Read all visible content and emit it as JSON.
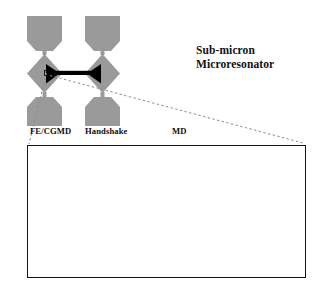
{
  "figure": {
    "title_line1": "Sub-micron",
    "title_line2": "Microresonator",
    "region_labels": [
      {
        "id": "fe-cgmd",
        "label": "FE/CGMD"
      },
      {
        "id": "handshake",
        "label": "Handshake"
      },
      {
        "id": "md",
        "label": "MD"
      }
    ],
    "colors": {
      "pad_gray": "#9a9a9a",
      "beam_black": "#000000",
      "panel_border": "#141414",
      "mesh_line": "#7d7d7d",
      "lattice_black": "#000000",
      "background": "#ffffff",
      "leader_dash": "#8c8c8c"
    },
    "schematic": {
      "description": "Two mirrored anchor pads with diamond-shaped flexures joined by a horizontal bowtie beam",
      "anchor_count": 4,
      "diamond_count": 2,
      "beam_count": 1
    },
    "panel": {
      "description": "Multiscale simulation domain: coarse finite-element / coarse-grained molecular dynamics mesh at left, graded handshake transition, full atomistic molecular dynamics lattice at right with a notched neck",
      "regions": 3
    }
  }
}
